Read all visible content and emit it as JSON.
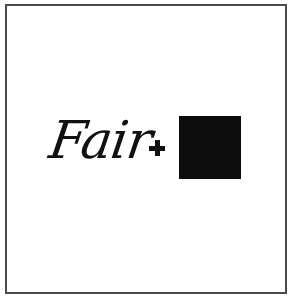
{
  "content": {
    "word": "Fair",
    "operator": "+",
    "square_color": "#0c0c0c"
  }
}
